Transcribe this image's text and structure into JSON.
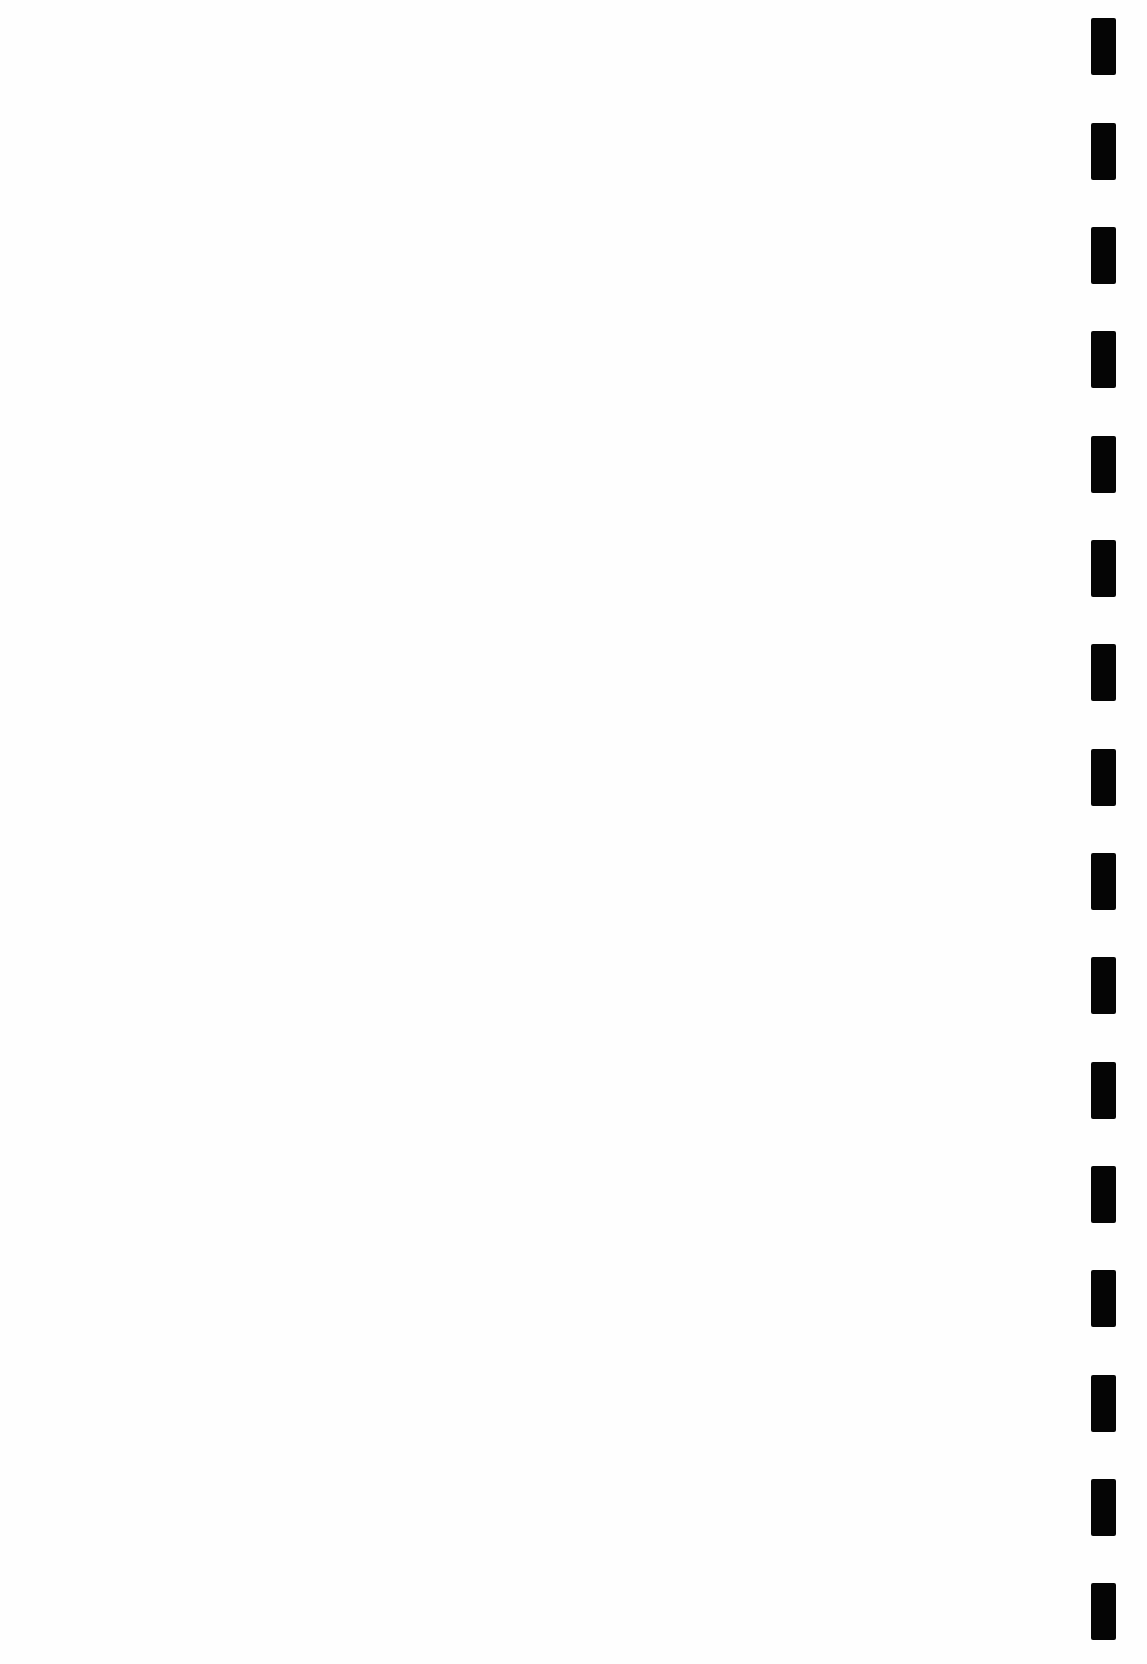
{
  "document": {
    "type": "scanned blank sheet",
    "background_color": "#fefefe",
    "mark_color": "#050505"
  },
  "timing_marks": {
    "count": 16,
    "x": 1091,
    "width": 25,
    "height": 57,
    "tops": [
      18,
      123,
      227,
      331,
      436,
      540,
      644,
      749,
      853,
      957,
      1062,
      1166,
      1270,
      1375,
      1479,
      1583
    ]
  }
}
